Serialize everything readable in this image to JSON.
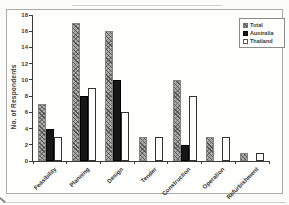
{
  "chart_data": {
    "type": "bar",
    "title": "",
    "xlabel": "",
    "ylabel": "No. of Respondents",
    "categories": [
      "Feasibility",
      "Planning",
      "Design",
      "Tender",
      "Construction",
      "Operation",
      "Refurbishment"
    ],
    "series": [
      {
        "name": "Total",
        "fill": "gray-hatch",
        "values": [
          7,
          17,
          16,
          3,
          10,
          3,
          1
        ]
      },
      {
        "name": "Australia",
        "fill": "black",
        "values": [
          4,
          8,
          10,
          0,
          2,
          0,
          0
        ]
      },
      {
        "name": "Thailand",
        "fill": "white-outline",
        "values": [
          3,
          9,
          6,
          3,
          8,
          3,
          1
        ]
      }
    ],
    "ylim": [
      0,
      18
    ],
    "y_ticks": [
      18,
      16,
      14,
      12,
      10,
      8,
      6,
      4,
      2,
      0
    ],
    "grid": false,
    "legend_position": "top-right"
  },
  "colors": {
    "total_fill": "#aeaeac",
    "australia_fill": "#161616",
    "thailand_fill": "#fdfdfb",
    "axis": "#3a3a3a",
    "frame_border": "#aaaaa6"
  }
}
